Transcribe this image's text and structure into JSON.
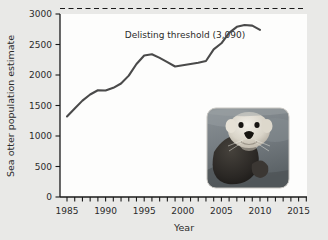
{
  "chart_data": {
    "type": "line",
    "title": "",
    "xlabel": "Year",
    "ylabel": "Sea otter population estimate",
    "xlim": [
      1984,
      2016
    ],
    "ylim": [
      0,
      3150
    ],
    "grid": false,
    "legend_position": "none",
    "x_ticks_major": [
      1985,
      1990,
      1995,
      2000,
      2005,
      2010,
      2015
    ],
    "x_tick_labels": [
      "1985",
      "1990",
      "1995",
      "2000",
      "2005",
      "2010",
      "2015"
    ],
    "x_tick_step_minor": 1,
    "y_ticks": [
      0,
      500,
      1000,
      1500,
      2000,
      2500,
      3000
    ],
    "y_tick_labels": [
      "0",
      "500",
      "1000",
      "1500",
      "2000",
      "2500",
      "3000"
    ],
    "series": [
      {
        "name": "Sea otter population estimate",
        "color": "#4a4a4a",
        "x": [
          1985,
          1986,
          1987,
          1988,
          1989,
          1990,
          1991,
          1992,
          1993,
          1994,
          1995,
          1996,
          1997,
          1998,
          1999,
          2000,
          2001,
          2002,
          2003,
          2004,
          2005,
          2006,
          2007,
          2008,
          2009,
          2010
        ],
        "values": [
          1320,
          1450,
          1580,
          1680,
          1750,
          1745,
          1790,
          1860,
          1990,
          2180,
          2320,
          2340,
          2280,
          2210,
          2140,
          2160,
          2180,
          2200,
          2230,
          2420,
          2520,
          2690,
          2790,
          2820,
          2810,
          2740
        ]
      }
    ],
    "annotations": [
      {
        "name": "delisting-threshold",
        "label": "Delisting threshold (3,090)",
        "type": "hline",
        "y": 3090,
        "style": "dashed",
        "color": "#1a1a1a"
      }
    ],
    "inset_image": {
      "name": "sea-otter-photo",
      "alt": "Sea otter floating on its back in water",
      "x_range": [
        2003,
        2013
      ],
      "y_range": [
        300,
        1450
      ]
    },
    "colors": {
      "background": "#e9e9e7",
      "plot_background": "#fdfdfc",
      "axis": "#1a1a1a",
      "line": "#4a4a4a",
      "text": "#2b2b2b"
    }
  }
}
